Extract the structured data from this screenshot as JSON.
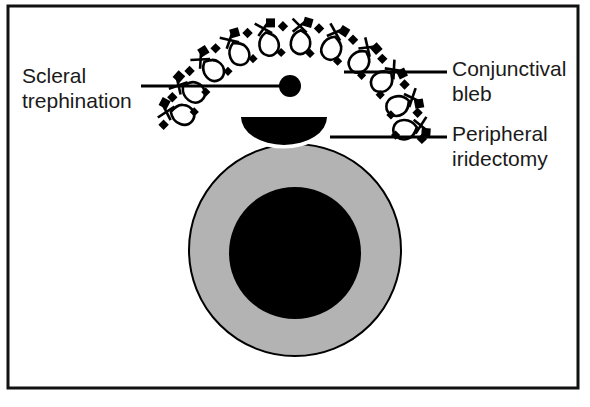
{
  "figure": {
    "background_color": "#ffffff",
    "frame": {
      "x": 8,
      "y": 6,
      "width": 570,
      "height": 382,
      "stroke_color": "#111111",
      "stroke_width": 3
    }
  },
  "labels": [
    {
      "id": "scleral-trephination",
      "line1": "Scleral",
      "line2": "trephination",
      "text_x": 22,
      "text_y1": 83,
      "text_y2": 108,
      "anchor": "start",
      "leader": {
        "x1": 141,
        "y1": 86,
        "x2": 283,
        "y2": 86
      },
      "marker": {
        "cx": 290,
        "cy": 86,
        "r": 11,
        "fill": "#000000"
      }
    },
    {
      "id": "conjunctival-bleb",
      "line1": "Conjunctival",
      "line2": "bleb",
      "text_x": 452,
      "text_y1": 76,
      "text_y2": 101,
      "anchor": "start",
      "leader": {
        "x1": 344,
        "y1": 72,
        "x2": 447,
        "y2": 72
      },
      "marker": null
    },
    {
      "id": "peripheral-iridectomy",
      "line1": "Peripheral",
      "line2": "iridectomy",
      "text_x": 452,
      "text_y1": 141,
      "text_y2": 166,
      "anchor": "start",
      "leader": {
        "x1": 330,
        "y1": 137,
        "x2": 447,
        "y2": 137
      },
      "marker": null
    }
  ],
  "eye": {
    "iris": {
      "cx": 295,
      "cy": 250,
      "r": 106,
      "fill": "#b3b3b3",
      "stroke": "#000000",
      "stroke_width": 2
    },
    "pupil": {
      "cx": 295,
      "cy": 253,
      "r": 66,
      "fill": "#000000"
    },
    "iridectomy": {
      "cx": 284,
      "cy": 143,
      "rx": 43,
      "ry": 28,
      "fill": "#000000",
      "halo_color": "#ffffff",
      "halo_width": 7
    }
  },
  "bleb": {
    "description": "dotted arc of sutures over the conjunctival bleb",
    "arc_cx": 292,
    "arc_cy": 143,
    "arc_rx": 130,
    "arc_ry": 117,
    "stroke": "#000000",
    "sutures": [
      {
        "angle": 196
      },
      {
        "angle": 210
      },
      {
        "angle": 226
      },
      {
        "angle": 242
      },
      {
        "angle": 258
      },
      {
        "angle": 274
      },
      {
        "angle": 290
      },
      {
        "angle": 306
      },
      {
        "angle": 322
      },
      {
        "angle": 338
      },
      {
        "angle": 352
      }
    ],
    "dashes": [
      {
        "angle": 189
      },
      {
        "angle": 203
      },
      {
        "angle": 218
      },
      {
        "angle": 234
      },
      {
        "angle": 250
      },
      {
        "angle": 266
      },
      {
        "angle": 282
      },
      {
        "angle": 298
      },
      {
        "angle": 314
      },
      {
        "angle": 330
      },
      {
        "angle": 345
      },
      {
        "angle": 358
      }
    ],
    "inner_dashes": [
      {
        "angle": 200,
        "inset": 26
      },
      {
        "angle": 214,
        "inset": 26
      },
      {
        "angle": 232,
        "inset": 26
      },
      {
        "angle": 248,
        "inset": 26
      },
      {
        "angle": 264,
        "inset": 26
      },
      {
        "angle": 280,
        "inset": 26
      },
      {
        "angle": 296,
        "inset": 26
      },
      {
        "angle": 312,
        "inset": 26
      },
      {
        "angle": 328,
        "inset": 26
      },
      {
        "angle": 342,
        "inset": 26
      },
      {
        "angle": 355,
        "inset": 26
      }
    ]
  }
}
